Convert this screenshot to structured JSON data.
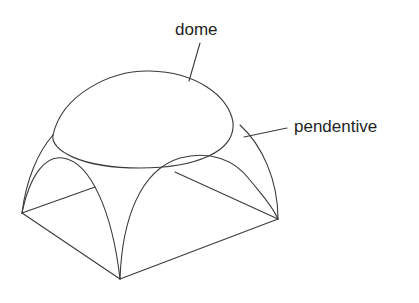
{
  "labels": {
    "dome": "dome",
    "pendentive": "pendentive"
  },
  "colors": {
    "background": "#ffffff",
    "line": "#3a3a3a",
    "text": "#1f1f1f"
  }
}
